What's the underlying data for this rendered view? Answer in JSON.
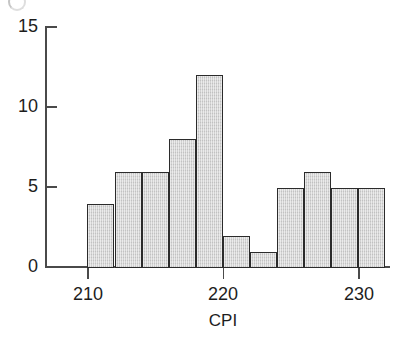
{
  "chart_data": {
    "type": "bar",
    "title": "",
    "subtitle": "",
    "xlabel": "CPI",
    "ylabel": "",
    "bin_width": 2,
    "bin_edges": [
      210,
      212,
      214,
      216,
      218,
      220,
      222,
      224,
      226,
      228,
      230,
      232
    ],
    "categories": [
      "210-212",
      "212-214",
      "214-216",
      "216-218",
      "218-220",
      "220-222",
      "222-224",
      "224-226",
      "226-228",
      "228-230",
      "230-232"
    ],
    "values": [
      4,
      6,
      6,
      8,
      12,
      2,
      1,
      5,
      6,
      5,
      5
    ],
    "x": [
      211,
      213,
      215,
      217,
      219,
      221,
      223,
      225,
      227,
      229,
      231
    ],
    "xlim": [
      210,
      232
    ],
    "ylim": [
      0,
      15
    ],
    "xticks": [
      210,
      220,
      230
    ],
    "xticklabels": [
      "210",
      "220",
      "230"
    ],
    "yticks": [
      0,
      5,
      10,
      15
    ],
    "yticklabels": [
      "0",
      "5",
      "10",
      "15"
    ],
    "grid": false,
    "legend": null,
    "legend_position": "none",
    "annotations": [],
    "bar_fill_color": "#d2d2d2",
    "bar_edge_color": "#2b2b2b",
    "axis_color": "#4a4a4a",
    "text_color": "#1d1d1d",
    "background_color": "#ffffff"
  },
  "figure": {
    "axis_title_x": "CPI",
    "y_tick_labels": [
      "15",
      "10",
      "5",
      "0"
    ],
    "x_tick_labels": [
      "210",
      "220",
      "230"
    ]
  }
}
